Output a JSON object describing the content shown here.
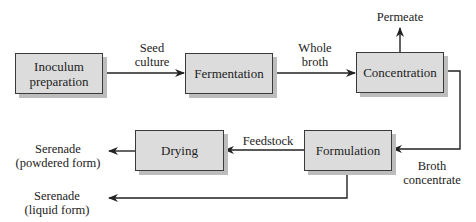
{
  "diagram": {
    "type": "process-flow",
    "nodes": [
      {
        "id": "inoculum",
        "label_line1": "Inoculum",
        "label_line2": "preparation"
      },
      {
        "id": "fermentation",
        "label": "Fermentation"
      },
      {
        "id": "concentration",
        "label": "Concentration"
      },
      {
        "id": "drying",
        "label": "Drying"
      },
      {
        "id": "formulation",
        "label": "Formulation"
      }
    ],
    "edges": [
      {
        "from": "inoculum",
        "to": "fermentation",
        "label_line1": "Seed",
        "label_line2": "culture"
      },
      {
        "from": "fermentation",
        "to": "concentration",
        "label_line1": "Whole",
        "label_line2": "broth"
      },
      {
        "from": "concentration",
        "to": "permeate",
        "label": "Permeate"
      },
      {
        "from": "concentration",
        "to": "formulation",
        "label_line1": "Broth",
        "label_line2": "concentrate"
      },
      {
        "from": "formulation",
        "to": "drying",
        "label": "Feedstock"
      },
      {
        "from": "drying",
        "to": "serenade-powder",
        "label_line1": "Serenade",
        "label_line2": "(powdered form)"
      },
      {
        "from": "formulation",
        "to": "serenade-liquid",
        "label_line1": "Serenade",
        "label_line2": "(liquid form)"
      }
    ]
  },
  "colors": {
    "box_fill": "#dcdcdc",
    "box_border": "#3a3a3a",
    "shadow": "#bdbdbd",
    "line": "#222222"
  }
}
